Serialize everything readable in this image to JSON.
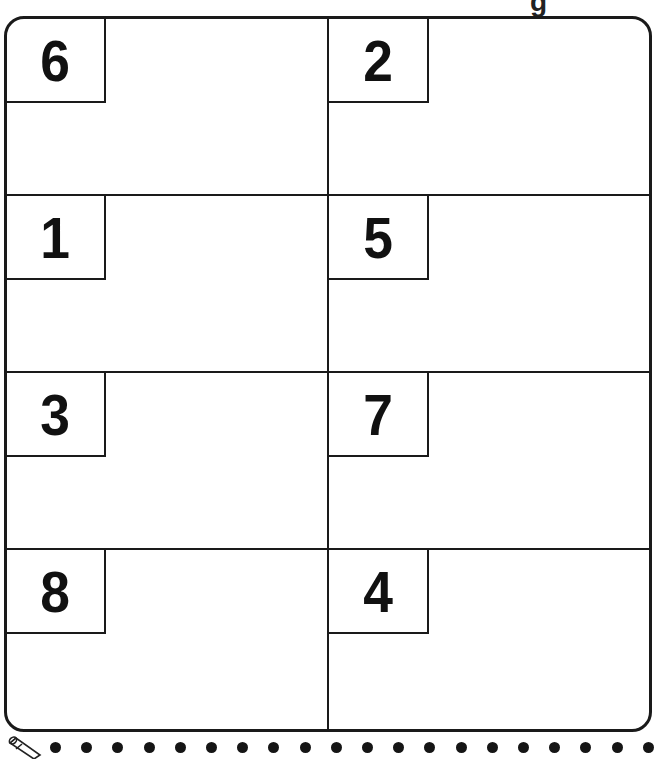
{
  "page": {
    "top_partial_text": "g",
    "panels": [
      {
        "row": 1,
        "col": 1,
        "number": "6"
      },
      {
        "row": 1,
        "col": 2,
        "number": "2"
      },
      {
        "row": 2,
        "col": 1,
        "number": "1"
      },
      {
        "row": 2,
        "col": 2,
        "number": "5"
      },
      {
        "row": 3,
        "col": 1,
        "number": "3"
      },
      {
        "row": 3,
        "col": 2,
        "number": "7"
      },
      {
        "row": 4,
        "col": 1,
        "number": "8"
      },
      {
        "row": 4,
        "col": 2,
        "number": "4"
      }
    ],
    "footer": {
      "icon": "pencil-icon",
      "dot_count": 20
    }
  }
}
